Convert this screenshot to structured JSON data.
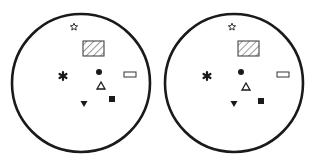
{
  "figure": {
    "stroke_color": "#1a1a1a",
    "panels": [
      {
        "id": "left",
        "circle": {
          "cx": 81,
          "cy": 83,
          "r": 69
        },
        "symbols": {
          "star": {
            "x": 74,
            "y": 27
          },
          "hatched_rectangle": {
            "x": 83,
            "y": 41,
            "w": 21,
            "h": 15
          },
          "asterisk": {
            "x": 63,
            "y": 76
          },
          "filled_circle": {
            "x": 99,
            "y": 72
          },
          "open_triangle": {
            "x": 101,
            "y": 86
          },
          "filled_square": {
            "x": 112,
            "y": 99
          },
          "filled_down_triangle": {
            "x": 84,
            "y": 104
          },
          "open_rectangle": {
            "x": 124,
            "y": 72,
            "w": 12,
            "h": 5
          }
        }
      },
      {
        "id": "right",
        "circle": {
          "cx": 234,
          "cy": 83,
          "r": 69
        },
        "symbols": {
          "star": {
            "x": 232,
            "y": 27
          },
          "hatched_rectangle": {
            "x": 238,
            "y": 41,
            "w": 21,
            "h": 15
          },
          "asterisk": {
            "x": 207,
            "y": 76
          },
          "filled_circle": {
            "x": 241,
            "y": 72
          },
          "open_triangle": {
            "x": 246,
            "y": 87
          },
          "filled_square": {
            "x": 261,
            "y": 101
          },
          "filled_down_triangle": {
            "x": 234,
            "y": 104
          },
          "open_rectangle": {
            "x": 277,
            "y": 72,
            "w": 12,
            "h": 5
          }
        }
      }
    ]
  }
}
